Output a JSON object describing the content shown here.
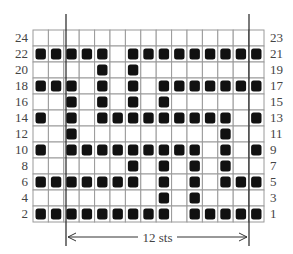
{
  "chart": {
    "title": "",
    "columns": 15,
    "rows": [
      {
        "left_label": "24",
        "right_label": "23",
        "cells": [
          0,
          0,
          0,
          0,
          0,
          0,
          0,
          0,
          0,
          0,
          0,
          0,
          0,
          0,
          0
        ]
      },
      {
        "left_label": "22",
        "right_label": "21",
        "cells": [
          1,
          1,
          1,
          1,
          1,
          0,
          1,
          1,
          1,
          1,
          1,
          1,
          1,
          1,
          1
        ]
      },
      {
        "left_label": "20",
        "right_label": "19",
        "cells": [
          0,
          0,
          0,
          0,
          1,
          0,
          1,
          0,
          0,
          0,
          0,
          0,
          0,
          0,
          0
        ]
      },
      {
        "left_label": "18",
        "right_label": "17",
        "cells": [
          1,
          1,
          1,
          0,
          1,
          0,
          1,
          0,
          1,
          1,
          1,
          1,
          1,
          1,
          1
        ]
      },
      {
        "left_label": "16",
        "right_label": "15",
        "cells": [
          0,
          0,
          1,
          0,
          1,
          0,
          1,
          0,
          1,
          0,
          0,
          0,
          0,
          0,
          0
        ]
      },
      {
        "left_label": "14",
        "right_label": "13",
        "cells": [
          1,
          0,
          1,
          0,
          1,
          1,
          1,
          1,
          1,
          1,
          1,
          1,
          1,
          0,
          1
        ]
      },
      {
        "left_label": "12",
        "right_label": "11",
        "cells": [
          0,
          0,
          1,
          0,
          0,
          0,
          0,
          0,
          0,
          0,
          0,
          0,
          1,
          0,
          0
        ]
      },
      {
        "left_label": "10",
        "right_label": "9",
        "cells": [
          1,
          0,
          1,
          1,
          1,
          1,
          1,
          1,
          1,
          1,
          1,
          0,
          1,
          0,
          1
        ]
      },
      {
        "left_label": "8",
        "right_label": "7",
        "cells": [
          0,
          0,
          0,
          0,
          0,
          0,
          1,
          0,
          1,
          0,
          1,
          0,
          1,
          0,
          0
        ]
      },
      {
        "left_label": "6",
        "right_label": "5",
        "cells": [
          1,
          1,
          1,
          1,
          1,
          1,
          1,
          0,
          1,
          0,
          1,
          0,
          1,
          1,
          1
        ]
      },
      {
        "left_label": "4",
        "right_label": "3",
        "cells": [
          0,
          0,
          0,
          0,
          0,
          0,
          0,
          0,
          1,
          0,
          1,
          0,
          0,
          0,
          0
        ]
      },
      {
        "left_label": "2",
        "right_label": "1",
        "cells": [
          1,
          1,
          1,
          1,
          1,
          1,
          1,
          1,
          1,
          0,
          1,
          1,
          1,
          1,
          1
        ]
      }
    ],
    "repeat_label": "12 sts",
    "colors": {
      "filled": "#111111",
      "grid": "#9a9a9a",
      "repeat_line": "#222222"
    }
  }
}
